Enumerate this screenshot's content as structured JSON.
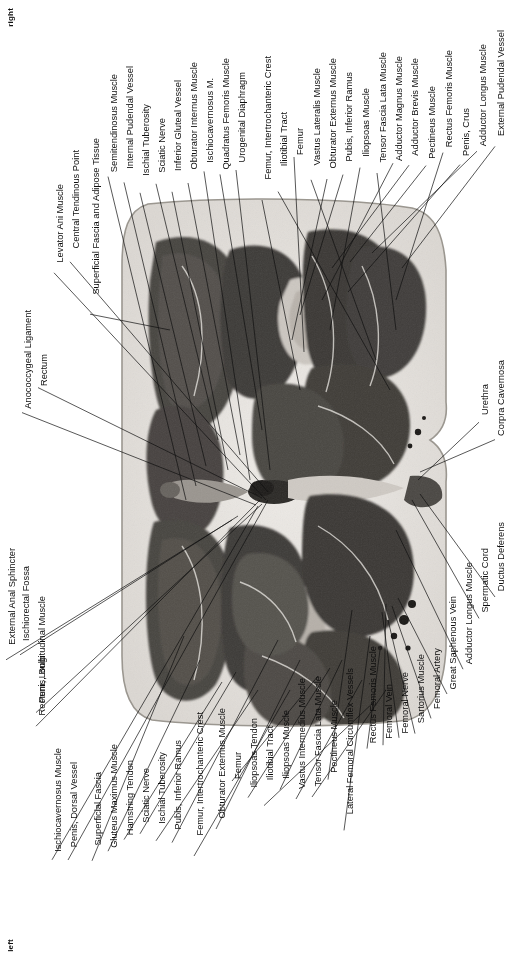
{
  "figure": {
    "type": "anatomical-cross-section-photograph",
    "region": "male pelvis / upper thigh transverse section",
    "orientation": {
      "top_marker": "right",
      "bottom_marker": "left"
    },
    "image": {
      "description": "Grayscale transverse anatomical section of the male perineum and proximal thighs",
      "background": "#ffffff",
      "specimen_tone_light": "#e8e6e2",
      "specimen_tone_mid": "#8d8a86",
      "specimen_tone_dark": "#3a3835"
    }
  },
  "labels": {
    "top_right_column": [
      "External Pudendal Vessel",
      "Adductor Longus Muscle",
      "Penis, Crus",
      "Rectus Femoris Muscle",
      "Pectineus Muscle",
      "Adductor Brevis Muscle",
      "Adductor Magnus Muscle",
      "Tensor Fascia Lata Muscle",
      "Iliopsoas Muscle",
      "Pubis, Inferior Ramus",
      "Obturator Externus Muscle",
      "Vastus Lateralis Muscle",
      "Femur",
      "Iliotibial Tract",
      "Femur, Intertrochanteric Crest",
      "Urogenital Diaphragm",
      "Quadratus Femoris Muscle",
      "Ischiocavernosus M.",
      "Obturator Internus Muscle",
      "Inferior Gluteal Vessel",
      "Sciatic Nerve",
      "Ischial Tuberosity",
      "Internal Pudendal Vessel",
      "Semitendinosus Muscle",
      "Superficial Fascia and Adipose Tissue",
      "Central Tendinous Point",
      "Levator Ani Muscle",
      "Rectum",
      "Anococcygeal Ligament"
    ],
    "right_side_column": [
      "Corpra Cavernosa",
      "Urethra",
      "Ductus Deferens",
      "Spermatic Cord",
      "Adductor Longus Muscle",
      "Great Saphenous Vein",
      "Femoral Artery",
      "Sartorius Muscle",
      "Femoral Nerve",
      "Femoral Vein",
      "Rectus Femoris Muscle",
      "Lateral Femoral Circumflex Vessels",
      "Pectineus Muscle",
      "Tensor Fascia Lata Muscle",
      "Vastus Intermedius Muscle",
      "Iliopsoas Muscle",
      "Iliotibial Tract",
      "Iliopsoas Tendon",
      "Femur",
      "Obturator Externus Muscle",
      "Femur, Intertrochanteric Crest",
      "Pubis, Inferior Ramus",
      "Ischial Tuberosity",
      "Sciatic Nerve",
      "Hamstring Tendon",
      "Gluteus Maximus Muscle",
      "Superficial Fascia",
      "Penis, Dorsal Vessel",
      "Ischiocavernosus Muscle",
      "Penis, Bulb",
      "Rectum, Longitudinal Muscle",
      "Ischiorectal Fossa",
      "External Anal Sphincter"
    ]
  },
  "label_positions": {
    "comment": "x,y are the text anchor (left,top) in page px; lx,ly are the leader-line endpoint on the specimen",
    "top": [
      {
        "t": "External Pudendal Vessel",
        "x": 497,
        "y": 30,
        "lx": null,
        "ly": null,
        "tx": 497,
        "ty": 158,
        "px": 402,
        "py": 268
      },
      {
        "t": "Adductor Longus Muscle",
        "x": 479,
        "y": 44,
        "tx": 479,
        "ty": 160,
        "px": 372,
        "py": 253
      },
      {
        "t": "Penis, Crus",
        "x": 462,
        "y": 108,
        "tx": 462,
        "ty": 165,
        "px": 348,
        "py": 292
      },
      {
        "t": "Rectus Femoris Muscle",
        "x": 445,
        "y": 50,
        "tx": 445,
        "ty": 170,
        "px": 396,
        "py": 300
      },
      {
        "t": "Pectineus Muscle",
        "x": 428,
        "y": 86,
        "tx": 428,
        "ty": 175,
        "px": 350,
        "py": 262
      },
      {
        "t": "Adductor Brevis Muscle",
        "x": 411,
        "y": 58,
        "tx": 411,
        "ty": 180,
        "px": 332,
        "py": 268
      },
      {
        "t": "Adductor Magnus Muscle",
        "x": 395,
        "y": 56,
        "tx": 395,
        "ty": 186,
        "px": 322,
        "py": 300
      },
      {
        "t": "Tensor Fascia Lata Muscle",
        "x": 379,
        "y": 52,
        "tx": 379,
        "ty": 190,
        "px": 396,
        "py": 330
      },
      {
        "t": "Iliopsoas Muscle",
        "x": 362,
        "y": 88,
        "tx": 362,
        "ty": 196,
        "px": 330,
        "py": 330
      },
      {
        "t": "Pubis, Inferior Ramus",
        "x": 345,
        "y": 72,
        "tx": 345,
        "ty": 200,
        "px": 300,
        "py": 315
      },
      {
        "t": "Obturator Externus Muscle",
        "x": 329,
        "y": 58,
        "tx": 329,
        "ty": 204,
        "px": 292,
        "py": 340
      },
      {
        "t": "Vastus Lateralis Muscle",
        "x": 313,
        "y": 68,
        "tx": 313,
        "ty": 208,
        "px": 376,
        "py": 360
      },
      {
        "t": "Femur",
        "x": 296,
        "y": 128,
        "tx": 296,
        "ty": 214,
        "px": 304,
        "py": 352
      },
      {
        "t": "Iliotibial Tract",
        "x": 280,
        "y": 112,
        "tx": 280,
        "ty": 220,
        "px": 390,
        "py": 390
      },
      {
        "t": "Femur, Intertrochanteric Crest",
        "x": 264,
        "y": 56,
        "tx": 264,
        "ty": 226,
        "px": 300,
        "py": 390
      },
      {
        "t": "Urogenital Diaphragm",
        "x": 238,
        "y": 72,
        "tx": 238,
        "ty": 232,
        "px": 270,
        "py": 470
      },
      {
        "t": "Quadratus Femoris Muscle",
        "x": 222,
        "y": 58,
        "tx": 222,
        "ty": 238,
        "px": 262,
        "py": 430
      },
      {
        "t": "Ischiocavernosus M.",
        "x": 206,
        "y": 78,
        "tx": 206,
        "ty": 244,
        "px": 250,
        "py": 480
      },
      {
        "t": "Obturator Internus Muscle",
        "x": 190,
        "y": 62,
        "tx": 190,
        "ty": 250,
        "px": 240,
        "py": 455
      },
      {
        "t": "Inferior Gluteal Vessel",
        "x": 174,
        "y": 80,
        "tx": 174,
        "ty": 256,
        "px": 228,
        "py": 470
      },
      {
        "t": "Sciatic Nerve",
        "x": 158,
        "y": 118,
        "tx": 158,
        "ty": 262,
        "px": 218,
        "py": 440
      },
      {
        "t": "Ischial Tuberosity",
        "x": 142,
        "y": 104,
        "tx": 142,
        "ty": 268,
        "px": 206,
        "py": 466
      },
      {
        "t": "Internal Pudendal Vessel",
        "x": 126,
        "y": 66,
        "tx": 126,
        "ty": 276,
        "px": 196,
        "py": 486
      },
      {
        "t": "Semitendinosus Muscle",
        "x": 110,
        "y": 74,
        "tx": 110,
        "ty": 282,
        "px": 186,
        "py": 500
      },
      {
        "t": "Superficial Fascia and Adipose Tissue",
        "x": 92,
        "y": 138,
        "tx": 92,
        "ty": 290,
        "px": 170,
        "py": 330
      },
      {
        "t": "Central Tendinous Point",
        "x": 72,
        "y": 150,
        "tx": 72,
        "ty": 302,
        "px": 268,
        "py": 492
      },
      {
        "t": "Levator Ani Muscle",
        "x": 56,
        "y": 184,
        "tx": 56,
        "ty": 330,
        "px": 266,
        "py": 500
      },
      {
        "t": "Rectum",
        "x": 40,
        "y": 354,
        "tx": 40,
        "ty": 360,
        "px": 262,
        "py": 498
      },
      {
        "t": "Anococcygeal Ligament",
        "x": 24,
        "y": 310,
        "tx": 24,
        "ty": 380,
        "px": 256,
        "py": 505
      }
    ],
    "right": [
      {
        "t": "Corpra Cavernosa",
        "x": 497,
        "y": 360,
        "px": 420,
        "py": 472
      },
      {
        "t": "Urethra",
        "x": 481,
        "y": 384,
        "px": 418,
        "py": 480
      },
      {
        "t": "Ductus Deferens",
        "x": 497,
        "y": 522,
        "px": 420,
        "py": 494
      },
      {
        "t": "Spermatic Cord",
        "x": 481,
        "y": 548,
        "px": 412,
        "py": 500
      },
      {
        "t": "Adductor Longus Muscle",
        "x": 465,
        "y": 562,
        "px": 396,
        "py": 530
      },
      {
        "t": "Great Saphenous Vein",
        "x": 449,
        "y": 596,
        "px": 398,
        "py": 598
      },
      {
        "t": "Femoral Artery",
        "x": 433,
        "y": 648,
        "px": 392,
        "py": 606
      },
      {
        "t": "Sartorius Muscle",
        "x": 417,
        "y": 654,
        "px": 388,
        "py": 620
      },
      {
        "t": "Femoral Nerve",
        "x": 401,
        "y": 672,
        "px": 382,
        "py": 612
      },
      {
        "t": "Femoral Vein",
        "x": 385,
        "y": 684,
        "px": 386,
        "py": 604
      },
      {
        "t": "Rectus Femoris Muscle",
        "x": 369,
        "y": 646,
        "px": 380,
        "py": 650
      },
      {
        "t": "Lateral Femoral Circumflex Vessels",
        "x": 346,
        "y": 668,
        "px": 370,
        "py": 636
      },
      {
        "t": "Pectineus Muscle",
        "x": 330,
        "y": 700,
        "px": 352,
        "py": 610
      },
      {
        "t": "Tensor Fascia Lata Muscle",
        "x": 314,
        "y": 676,
        "px": 386,
        "py": 690
      },
      {
        "t": "Vastus Intermedius Muscle",
        "x": 298,
        "y": 678,
        "px": 362,
        "py": 680
      },
      {
        "t": "Iliopsoas Muscle",
        "x": 282,
        "y": 710,
        "px": 342,
        "py": 660
      },
      {
        "t": "Iliotibial Tract",
        "x": 266,
        "y": 726,
        "px": 376,
        "py": 700
      },
      {
        "t": "Iliopsoas Tendon",
        "x": 250,
        "y": 718,
        "px": 330,
        "py": 668
      },
      {
        "t": "Femur",
        "x": 234,
        "y": 752,
        "px": 318,
        "py": 676
      },
      {
        "t": "Obturator Externus Muscle",
        "x": 218,
        "y": 708,
        "px": 300,
        "py": 660
      },
      {
        "t": "Femur, Intertrochanteric Crest",
        "x": 196,
        "y": 712,
        "px": 290,
        "py": 690
      },
      {
        "t": "Pubis, Inferior Ramus",
        "x": 174,
        "y": 740,
        "px": 278,
        "py": 640
      },
      {
        "t": "Ischial Tuberosity",
        "x": 158,
        "y": 752,
        "px": 258,
        "py": 690
      },
      {
        "t": "Sciatic Nerve",
        "x": 142,
        "y": 768,
        "px": 236,
        "py": 672
      },
      {
        "t": "Hamstring Tendon",
        "x": 126,
        "y": 760,
        "px": 222,
        "py": 682
      },
      {
        "t": "Gluteus Maximus Muscle",
        "x": 110,
        "y": 744,
        "px": 200,
        "py": 660
      },
      {
        "t": "Superficial Fascia",
        "x": 94,
        "y": 772,
        "px": 184,
        "py": 636
      },
      {
        "t": "Penis, Dorsal Vessel",
        "x": 70,
        "y": 762,
        "px": 268,
        "py": 500
      },
      {
        "t": "Ischiocavernosus Muscle",
        "x": 54,
        "y": 748,
        "px": 258,
        "py": 506
      },
      {
        "t": "Penis, Bulb",
        "x": 38,
        "y": 656,
        "px": 262,
        "py": 504
      },
      {
        "t": "Rectum, Longitudinal Muscle",
        "x": 38,
        "y": 596,
        "px": 260,
        "py": 500
      },
      {
        "t": "Ischiorectal Fossa",
        "x": 22,
        "y": 566,
        "px": 238,
        "py": 516
      },
      {
        "t": "External Anal Sphincter",
        "x": 8,
        "y": 548,
        "px": 232,
        "py": 520
      }
    ]
  }
}
